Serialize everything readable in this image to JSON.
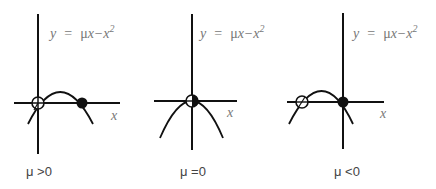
{
  "panels": [
    {
      "id": "mu-positive",
      "equation": {
        "y": "y",
        "eq": "=",
        "mu": "μ",
        "rest": "x−x",
        "exp": "2"
      },
      "x_label": "x",
      "caption": "μ >0",
      "fixed_points": [
        {
          "x": "0",
          "stability": "unstable",
          "style": "open"
        },
        {
          "x": "μ",
          "stability": "stable",
          "style": "filled"
        }
      ]
    },
    {
      "id": "mu-zero",
      "equation": {
        "y": "y",
        "eq": "=",
        "mu": "μ",
        "rest": "x−x",
        "exp": "2"
      },
      "x_label": "x",
      "caption": "μ =0",
      "fixed_points": [
        {
          "x": "0",
          "stability": "semi-stable",
          "style": "half-filled"
        }
      ]
    },
    {
      "id": "mu-negative",
      "equation": {
        "y": "y",
        "eq": "=",
        "mu": "μ",
        "rest": "x−x",
        "exp": "2"
      },
      "x_label": "x",
      "caption": "μ <0",
      "fixed_points": [
        {
          "x": "μ",
          "stability": "unstable",
          "style": "open"
        },
        {
          "x": "0",
          "stability": "stable",
          "style": "filled"
        }
      ]
    }
  ],
  "colors": {
    "line": "#111111",
    "text": "#777777",
    "caption": "#444444"
  }
}
